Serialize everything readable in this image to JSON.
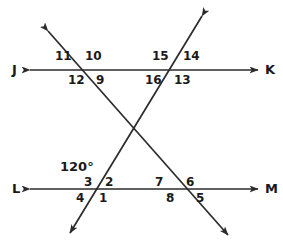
{
  "diagram": {
    "type": "geometry-transversals",
    "background_color": "#ffffff",
    "stroke_color": "#2b2b2b",
    "text_color": "#1a1a1a",
    "lines": {
      "jk": {
        "name": "line-jk",
        "orientation": "horizontal",
        "y": 70,
        "x_start": 30,
        "x_end": 258,
        "arrows": "both",
        "left_endpoint_label": "J",
        "right_endpoint_label": "K"
      },
      "lm": {
        "name": "line-lm",
        "orientation": "horizontal",
        "y": 189,
        "x_start": 30,
        "x_end": 258,
        "arrows": "both",
        "left_endpoint_label": "L",
        "right_endpoint_label": "M"
      },
      "transversal_a": {
        "name": "transversal-upper-left-to-lower-right",
        "x1": 48,
        "y1": 31,
        "x2": 228,
        "y2": 235,
        "arrows": "both"
      },
      "transversal_b": {
        "name": "transversal-upper-right-to-lower-left",
        "x1": 202,
        "y1": 16,
        "x2": 70,
        "y2": 233,
        "arrows": "both"
      }
    },
    "intersections": [
      {
        "name": "jk-left",
        "x": 85,
        "y": 70
      },
      {
        "name": "jk-right",
        "x": 172,
        "y": 70
      },
      {
        "name": "lm-left",
        "x": 100,
        "y": 189
      },
      {
        "name": "lm-right",
        "x": 185,
        "y": 189
      },
      {
        "name": "transversal-crossing",
        "x": 135,
        "y": 130
      }
    ],
    "endpoint_labels": {
      "j": "J",
      "k": "K",
      "l": "L",
      "m": "M"
    },
    "angle_labels": {
      "a11": "11",
      "a10": "10",
      "a12": "12",
      "a9": "9",
      "a15": "15",
      "a14": "14",
      "a16": "16",
      "a13": "13",
      "a3": "3",
      "a2": "2",
      "a4": "4",
      "a1": "1",
      "a7": "7",
      "a6": "6",
      "a8": "8",
      "a5": "5"
    },
    "measures": {
      "given_angle": "120°"
    }
  }
}
